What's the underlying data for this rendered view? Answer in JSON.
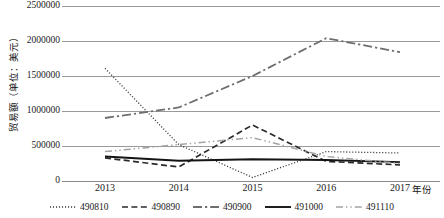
{
  "chart_data": {
    "type": "line",
    "title": "",
    "xlabel": "年份",
    "ylabel": "贸易额（单位：美元）",
    "categories": [
      "2013",
      "2014",
      "2015",
      "2016",
      "2017"
    ],
    "x": [
      2013,
      2014,
      2015,
      2016,
      2017
    ],
    "ylim": [
      0,
      2500000
    ],
    "yticks": [
      "0",
      "500000",
      "1000000",
      "1500000",
      "2000000",
      "2500000"
    ],
    "ytick_values": [
      0,
      500000,
      1000000,
      1500000,
      2000000,
      2500000
    ],
    "grid": true,
    "legend_position": "bottom",
    "series": [
      {
        "name": "490810",
        "values": [
          1610000,
          520000,
          50000,
          420000,
          400000
        ],
        "style": "dotted",
        "color": "#3a3a3a",
        "width": 1.3
      },
      {
        "name": "490890",
        "values": [
          330000,
          200000,
          800000,
          280000,
          230000
        ],
        "style": "dashed",
        "color": "#2b2b2b",
        "width": 1.7
      },
      {
        "name": "490900",
        "values": [
          900000,
          1050000,
          1500000,
          2040000,
          1840000
        ],
        "style": "dashdot",
        "color": "#6e6e6e",
        "width": 1.8
      },
      {
        "name": "491000",
        "values": [
          350000,
          290000,
          310000,
          300000,
          270000
        ],
        "style": "solid",
        "color": "#141414",
        "width": 1.9
      },
      {
        "name": "491110",
        "values": [
          420000,
          520000,
          620000,
          350000,
          250000
        ],
        "style": "dashdotdot",
        "color": "#a3a3a3",
        "width": 1.5
      }
    ]
  },
  "axis": {
    "y_title": "贸易额（单位：美元）",
    "x_title": "年份"
  }
}
